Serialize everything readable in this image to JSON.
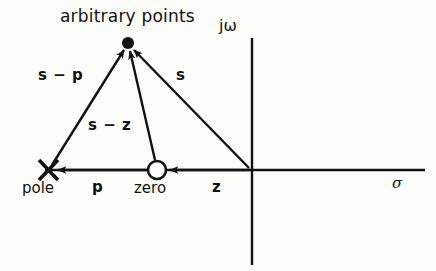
{
  "figure": {
    "title": "arbitrary points",
    "kind": "pole-zero-plot",
    "plane": "s-plane"
  },
  "axes": {
    "imaginary_label": "jω",
    "real_label": "σ",
    "origin": {
      "x": 252,
      "y": 170
    },
    "horizontal": {
      "x1": 45,
      "y1": 170,
      "x2": 425,
      "y2": 170
    },
    "vertical": {
      "x1": 252,
      "y1": 38,
      "x2": 252,
      "y2": 265
    }
  },
  "markers": {
    "pole": {
      "label": "pole",
      "glyph": "x-cross",
      "x": 48,
      "y": 170
    },
    "zero": {
      "label": "zero",
      "glyph": "open-circle",
      "x": 157,
      "y": 170,
      "radius": 9
    },
    "point": {
      "label": "arbitrary points",
      "glyph": "filled-dot",
      "x": 128,
      "y": 43,
      "radius": 6
    }
  },
  "vectors": [
    {
      "name": "s-minus-p",
      "label": "s − p",
      "from": "pole",
      "to": "point",
      "x1": 52,
      "y1": 165,
      "x2": 124,
      "y2": 50
    },
    {
      "name": "s-minus-z",
      "label": "s − z",
      "from": "zero",
      "to": "point",
      "x1": 155,
      "y1": 160,
      "x2": 130,
      "y2": 51
    },
    {
      "name": "s",
      "label": "s",
      "from": "origin",
      "to": "point",
      "x1": 249,
      "y1": 168,
      "x2": 134,
      "y2": 50
    },
    {
      "name": "p",
      "label": "p",
      "from": "zero",
      "to": "pole",
      "x1": 150,
      "y1": 170,
      "x2": 56,
      "y2": 170
    },
    {
      "name": "z",
      "label": "z",
      "from": "origin",
      "to": "zero",
      "x1": 250,
      "y1": 170,
      "x2": 168,
      "y2": 170
    }
  ],
  "label_positions": {
    "title": {
      "x": 60,
      "y": 12
    },
    "s_minus_p": {
      "x": 38,
      "y": 68
    },
    "s_minus_z": {
      "x": 88,
      "y": 118
    },
    "s": {
      "x": 176,
      "y": 68
    },
    "pole": {
      "x": 22,
      "y": 180
    },
    "p": {
      "x": 92,
      "y": 180
    },
    "zero": {
      "x": 134,
      "y": 180
    },
    "z": {
      "x": 212,
      "y": 180
    },
    "jomega": {
      "x": 219,
      "y": 21
    },
    "sigma": {
      "x": 392,
      "y": 176
    }
  },
  "colors": {
    "ink": "#111111",
    "background": "#fdfdfb"
  }
}
